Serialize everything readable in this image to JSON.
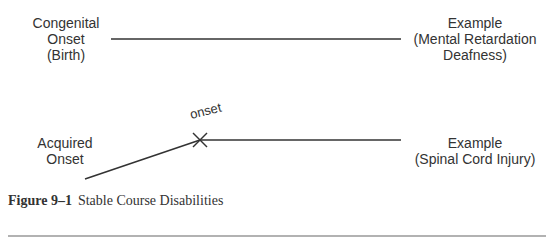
{
  "diagram": {
    "row1": {
      "left_label": [
        "Congenital",
        "Onset",
        "(Birth)"
      ],
      "right_label": [
        "Example",
        "(Mental Retardation",
        "Deafness)"
      ]
    },
    "row2": {
      "left_label": [
        "Acquired",
        "Onset"
      ],
      "marker_label": "onset",
      "right_label": [
        "Example",
        "(Spinal Cord Injury)"
      ]
    }
  },
  "caption": {
    "number": "Figure 9–1",
    "title": "Stable Course Disabilities"
  }
}
